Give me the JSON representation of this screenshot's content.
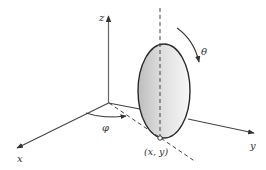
{
  "diagram": {
    "type": "3d-coordinate-diagram",
    "labels": {
      "z_axis": "z",
      "x_axis": "x",
      "y_axis": "y",
      "theta": "θ",
      "phi": "φ",
      "contact_point": "(x, y)"
    },
    "colors": {
      "axis": "#555555",
      "ellipse_stroke": "#2a2a2a",
      "ellipse_fill_dark": "#c8c8c8",
      "ellipse_fill_light": "#f4f4f4",
      "dashed": "#444444",
      "label": "#333333"
    }
  }
}
